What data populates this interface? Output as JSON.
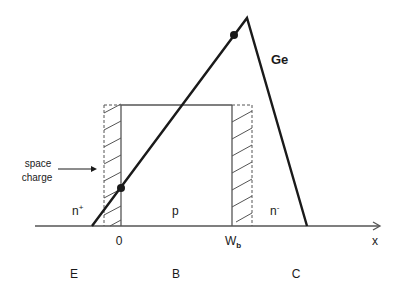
{
  "diagram": {
    "type": "band/field profile in bipolar transistor",
    "curve_label": "Ge",
    "axis_label": "x",
    "origin_label": "0",
    "base_width_label": "W",
    "base_width_subscript": "b",
    "annotation": {
      "line1": "space",
      "line2": "charge"
    },
    "doping_labels": {
      "emitter": "n",
      "emitter_sup": "+",
      "base": "p",
      "collector": "n",
      "collector_sup": "-"
    },
    "region_labels": {
      "emitter": "E",
      "base": "B",
      "collector": "C"
    },
    "colors": {
      "line": "#1a1a1a",
      "box": "#555555",
      "background": "#ffffff"
    }
  }
}
